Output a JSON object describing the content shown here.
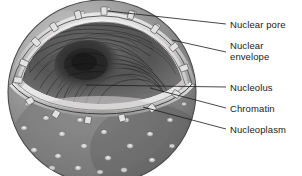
{
  "figure": {
    "name": "cell-nucleus-cutaway-diagram",
    "style": "grayscale pen-and-ink / airbrush illustration",
    "background_color": "#ffffff"
  },
  "palette": {
    "background": "#ffffff",
    "outer_membrane_light": "#b9b9b9",
    "outer_membrane_mid": "#8a8a8a",
    "outer_membrane_dark": "#6a6a6a",
    "lower_surface": "#7c7c7c",
    "envelope_rim": "#cfcfcf",
    "nucleoplasm_floor": "#eceaea",
    "chromatin_dark": "#3c3c3c",
    "nucleolus_core": "#2a2a2a",
    "pore_ring": "#d8d8d8",
    "leader_line": "#1a1a1a",
    "label_text": "#1a1a1a"
  },
  "labels": [
    {
      "id": "nuclear-pore",
      "text": "Nuclear pore",
      "x": 230,
      "y": 19,
      "lines": [
        "Nuclear pore"
      ]
    },
    {
      "id": "nuclear-envelope",
      "text": "Nuclear envelope",
      "x": 230,
      "y": 46,
      "lines": [
        "Nuclear",
        "envelope"
      ]
    },
    {
      "id": "nucleolus",
      "text": "Nucleolus",
      "x": 230,
      "y": 82,
      "lines": [
        "Nucleolus"
      ]
    },
    {
      "id": "chromatin",
      "text": "Chromatin",
      "x": 230,
      "y": 103,
      "lines": [
        "Chromatin"
      ]
    },
    {
      "id": "nucleoplasm",
      "text": "Nucleoplasm",
      "x": 230,
      "y": 124,
      "lines": [
        "Nucleoplasm"
      ]
    }
  ],
  "leaders": [
    {
      "id": "leader-nuclear-pore",
      "from": [
        108,
        11
      ],
      "to": [
        226,
        24
      ]
    },
    {
      "id": "leader-nuclear-envelope",
      "from": [
        172,
        40
      ],
      "to": [
        226,
        52
      ]
    },
    {
      "id": "leader-nucleolus",
      "from": [
        86,
        85
      ],
      "to": [
        226,
        87
      ]
    },
    {
      "id": "leader-chromatin",
      "from": [
        150,
        88
      ],
      "to": [
        226,
        108
      ]
    },
    {
      "id": "leader-nucleoplasm",
      "from": [
        143,
        107
      ],
      "to": [
        226,
        129
      ]
    }
  ],
  "structures": [
    {
      "id": "nuclear-envelope",
      "description": "double membrane ring around the cut opening, studded with pore bridges"
    },
    {
      "id": "nuclear-pores",
      "description": "small ringed openings on the outer surface and bridges across the rim"
    },
    {
      "id": "chromatin",
      "description": "wavy dark fibers filling the nuclear interior"
    },
    {
      "id": "nucleolus",
      "description": "dense dark mass near the centre of the nucleus"
    },
    {
      "id": "nucleoplasm",
      "description": "pale interior floor of the cut nucleus"
    }
  ]
}
